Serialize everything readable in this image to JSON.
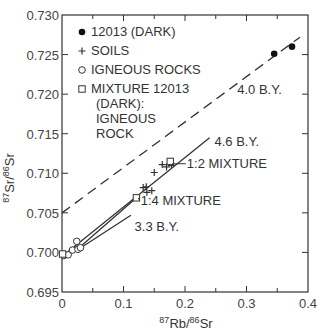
{
  "chart_data": {
    "type": "scatter",
    "title": "",
    "xlabel": {
      "sup1": "87",
      "main1": "Rb/",
      "sup2": "86",
      "main2": "Sr"
    },
    "ylabel": {
      "sup1": "87",
      "main1": "Sr/",
      "sup2": "86",
      "main2": "Sr"
    },
    "xlim": [
      0,
      0.4
    ],
    "ylim": [
      0.695,
      0.73
    ],
    "grid": false,
    "x_ticks": [
      0,
      0.1,
      0.2,
      0.3,
      0.4
    ],
    "x_tick_labels": [
      "0",
      "0.1",
      "0.2",
      "0.3",
      "0.4"
    ],
    "x_minor_ticks": [
      0.05,
      0.15,
      0.25,
      0.35
    ],
    "y_ticks": [
      0.695,
      0.7,
      0.705,
      0.71,
      0.715,
      0.72,
      0.725,
      0.73
    ],
    "y_tick_labels": [
      "0.695",
      "0.700",
      "0.705",
      "0.710",
      "0.715",
      "0.720",
      "0.725",
      "0.730"
    ],
    "legend": {
      "placement": "top-left",
      "entries": [
        {
          "marker": "filled-circle",
          "label": "12013 (DARK)"
        },
        {
          "marker": "plus",
          "label": "SOILS"
        },
        {
          "marker": "open-circle",
          "label": "IGNEOUS ROCKS"
        },
        {
          "marker": "open-square",
          "label": "MIXTURE 12013",
          "extra_lines": [
            "(DARK):",
            "IGNEOUS",
            "ROCK"
          ]
        }
      ]
    },
    "series": [
      {
        "name": "12013 (DARK)",
        "marker": "filled-circle",
        "points": [
          [
            0.345,
            0.7251
          ],
          [
            0.374,
            0.726
          ]
        ]
      },
      {
        "name": "SOILS",
        "marker": "plus",
        "points": [
          [
            0.132,
            0.7082
          ],
          [
            0.138,
            0.7076
          ],
          [
            0.146,
            0.7078
          ],
          [
            0.15,
            0.7101
          ],
          [
            0.163,
            0.7111
          ],
          [
            0.17,
            0.7108
          ],
          [
            0.178,
            0.711
          ],
          [
            0.137,
            0.7083
          ]
        ]
      },
      {
        "name": "IGNEOUS ROCKS",
        "marker": "open-circle",
        "points": [
          [
            0.003,
            0.6996
          ],
          [
            0.01,
            0.6997
          ],
          [
            0.017,
            0.7003
          ],
          [
            0.024,
            0.7014
          ],
          [
            0.026,
            0.7004
          ],
          [
            0.03,
            0.7006
          ]
        ]
      },
      {
        "name": "MIXTURE 12013 (DARK): IGNEOUS ROCK",
        "marker": "open-square",
        "points": [
          [
            0.001,
            0.6998
          ],
          [
            0.121,
            0.7069
          ],
          [
            0.176,
            0.7115
          ]
        ]
      }
    ],
    "lines": [
      {
        "name": "4.0 B.Y.",
        "style": "dashed",
        "from": [
          0.0,
          0.705
        ],
        "to": [
          0.387,
          0.7272
        ]
      },
      {
        "name": "4.6 B.Y.",
        "style": "solid",
        "from": [
          0.0,
          0.6995
        ],
        "to": [
          0.24,
          0.7145
        ]
      },
      {
        "name": "3.3 B.Y.",
        "style": "solid",
        "from": [
          0.025,
          0.7003
        ],
        "to": [
          0.112,
          0.7047
        ]
      },
      {
        "name": "mixing",
        "style": "solid",
        "from": [
          0.025,
          0.7004
        ],
        "to": [
          0.121,
          0.7069
        ]
      }
    ],
    "annotations": [
      {
        "text": "4.0 B.Y.",
        "x": 0.285,
        "y": 0.72
      },
      {
        "text": "4.6 B.Y.",
        "x": 0.248,
        "y": 0.7135
      },
      {
        "text": "1:2 MIXTURE",
        "x": 0.203,
        "y": 0.7107,
        "leader_to": [
          0.179,
          0.7112
        ]
      },
      {
        "text": "1:4 MIXTURE",
        "x": 0.128,
        "y": 0.706,
        "leader_to": [
          0.124,
          0.7069
        ]
      },
      {
        "text": "3.3 B.Y.",
        "x": 0.118,
        "y": 0.7027
      }
    ]
  }
}
